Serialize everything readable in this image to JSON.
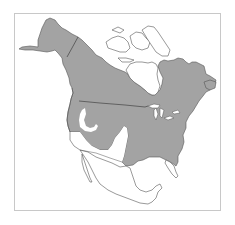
{
  "map": {
    "subject": "North America range map",
    "colors": {
      "background": "#ffffff",
      "frame": "#c8c8c8",
      "range_fill": "#a3a3a3",
      "land_fill": "#ffffff",
      "outline": "#555555",
      "border": "#333333"
    },
    "regions": [
      {
        "name": "range",
        "description": "Shaded range covering Alaska, most of Canada, and eastern/northern United States"
      },
      {
        "name": "arctic-islands",
        "description": "Unshaded Canadian Arctic Archipelago"
      },
      {
        "name": "hudson-bay",
        "description": "Hudson Bay (water)"
      },
      {
        "name": "great-basin-gap",
        "description": "Unshaded hook in the Great Basin"
      },
      {
        "name": "southwest-gap",
        "description": "Unshaded southwestern United States"
      },
      {
        "name": "mexico",
        "description": "Unshaded Mexico and Central America"
      }
    ]
  }
}
